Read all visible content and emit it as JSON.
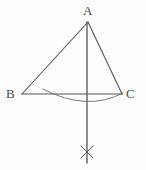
{
  "figure": {
    "name": "triangle-perpendicular-bisector-construction",
    "background_color": "#fdfdfd",
    "stroke_color": "#555555",
    "stroke_width": 1.1,
    "width": 146,
    "height": 170
  },
  "labels": {
    "apex": "A",
    "left_base": "B",
    "right_base": "C"
  },
  "points": {
    "A": {
      "x": 88,
      "y": 22
    },
    "B": {
      "x": 22,
      "y": 94
    },
    "C": {
      "x": 122,
      "y": 94
    },
    "cross_mark": {
      "x": 87,
      "y": 152
    },
    "vertical_bottom": {
      "x": 87,
      "y": 163
    },
    "arc_start": {
      "x": 43,
      "y": 89
    },
    "arc_end": {
      "x": 123,
      "y": 93
    },
    "arc_lowest": {
      "x": 87,
      "y": 102
    }
  },
  "segments": {
    "side_AB": "M 88 22 L 22 94",
    "side_AC": "M 88 22 L 122 94",
    "side_BC": "M 22 94 L 122 94",
    "vertical_line": "M 87 22 L 87 163",
    "compass_arc": "M 43 89 Q 87 112 123 93",
    "cross_stroke_1": "M 81 146 L 93 158",
    "cross_stroke_2": "M 93 146 L 81 158"
  },
  "elements": {
    "apex_label_name": "vertex-label-a",
    "left_label_name": "vertex-label-b",
    "right_label_name": "vertex-label-c",
    "arc_name": "compass-arc",
    "cross_name": "arc-intersection-cross",
    "vertical_name": "perpendicular-bisector-line"
  }
}
